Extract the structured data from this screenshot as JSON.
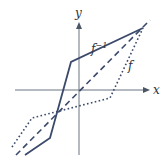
{
  "figure": {
    "axes": {
      "x_label": "x",
      "y_label": "y",
      "origin_px": [
        79,
        90
      ]
    },
    "curves": [
      {
        "name": "f-inverse",
        "label": "f",
        "label_sup": "−1",
        "style": "solid",
        "color": "#3b4a6b",
        "points_px": [
          [
            25,
            155
          ],
          [
            50,
            138
          ],
          [
            71,
            62
          ],
          [
            143,
            28
          ]
        ]
      },
      {
        "name": "identity-line",
        "label": "",
        "style": "dashed",
        "color": "#3b4a6b",
        "points_px": [
          [
            16,
            155
          ],
          [
            150,
            20
          ]
        ]
      },
      {
        "name": "f",
        "label": "f",
        "style": "dotted",
        "color": "#3b4a6b",
        "points_px": [
          [
            12,
            147
          ],
          [
            32,
            118
          ],
          [
            110,
            98
          ],
          [
            143,
            28
          ]
        ]
      }
    ],
    "colors": {
      "axis": "#6b7280",
      "curve": "#3b4a6b",
      "background": "#ffffff"
    }
  }
}
